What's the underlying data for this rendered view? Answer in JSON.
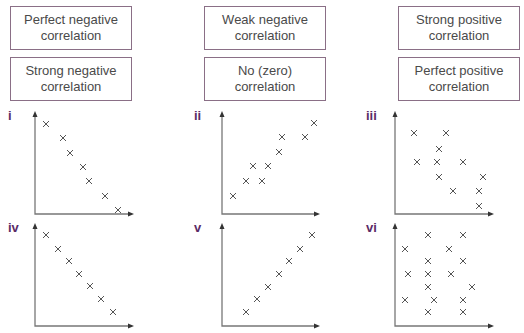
{
  "boxes": [
    {
      "id": "perfect-negative",
      "line1": "Perfect negative",
      "line2": "correlation"
    },
    {
      "id": "strong-negative",
      "line1": "Strong negative",
      "line2": "correlation"
    },
    {
      "id": "weak-negative",
      "line1": "Weak negative",
      "line2": "correlation"
    },
    {
      "id": "no-zero",
      "line1": "No (zero)",
      "line2": "correlation"
    },
    {
      "id": "strong-positive",
      "line1": "Strong positive",
      "line2": "correlation"
    },
    {
      "id": "perfect-positive",
      "line1": "Perfect positive",
      "line2": "correlation"
    }
  ],
  "graphs": [
    {
      "label": "i"
    },
    {
      "label": "ii"
    },
    {
      "label": "iii"
    },
    {
      "label": "iv"
    },
    {
      "label": "v"
    },
    {
      "label": "vi"
    }
  ],
  "colors": {
    "label": "#5b2b66",
    "box_border": "#8a6f86",
    "text": "#4a4a4a"
  },
  "marker": "×"
}
